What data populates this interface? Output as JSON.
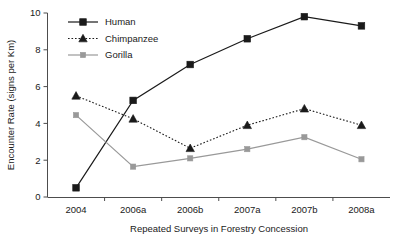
{
  "chart_data": {
    "type": "line",
    "title": "",
    "xlabel": "Repeated Surveys in Forestry Concession",
    "ylabel": "Encounter Rate (signs per Km)",
    "categories": [
      "2004",
      "2006a",
      "2006b",
      "2007a",
      "2007b",
      "2008a"
    ],
    "ylim": [
      0,
      10
    ],
    "yticks": [
      0,
      2,
      4,
      6,
      8,
      10
    ],
    "ytick_labels": [
      "0",
      "2",
      "4",
      "6",
      "8",
      "10"
    ],
    "grid": false,
    "legend_position": "top-left-inside",
    "series": [
      {
        "name": "Human",
        "values": [
          0.5,
          5.25,
          7.2,
          8.6,
          9.8,
          9.3
        ],
        "color": "#1a1a1a",
        "marker": "square",
        "line_style": "solid"
      },
      {
        "name": "Chimpanzee",
        "values": [
          5.5,
          4.25,
          2.65,
          3.9,
          4.8,
          3.9
        ],
        "color": "#1a1a1a",
        "marker": "triangle",
        "line_style": "dotted"
      },
      {
        "name": "Gorilla",
        "values": [
          4.45,
          1.65,
          2.1,
          2.6,
          3.25,
          2.05
        ],
        "color": "#999999",
        "marker": "square-small",
        "line_style": "solid"
      }
    ]
  }
}
